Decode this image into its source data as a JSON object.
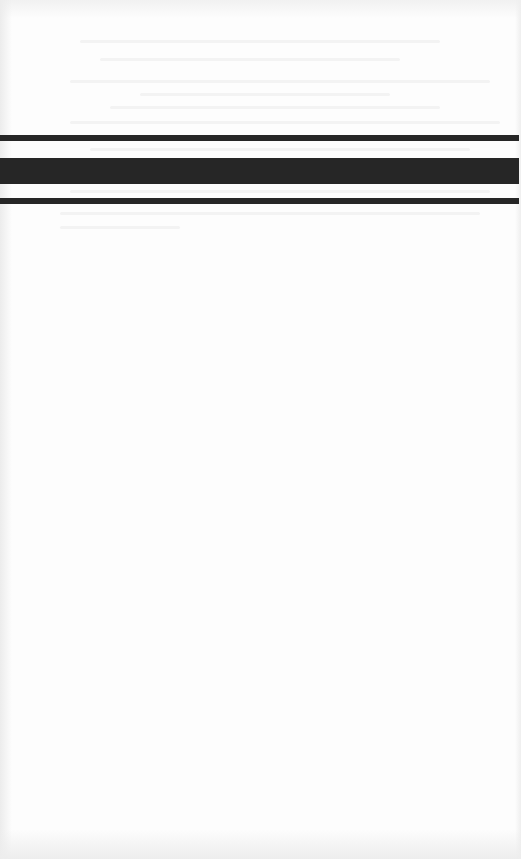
{
  "document": {
    "type": "scanned-page",
    "background_color": "#fdfdfd",
    "text_content": "",
    "divider": {
      "description": "triple horizontal rule (thin / thick / thin)",
      "color": "#262626",
      "rules": [
        {
          "name": "top-thin-rule",
          "top": 135,
          "height": 6
        },
        {
          "name": "thick-rule",
          "top": 158,
          "height": 26
        },
        {
          "name": "bottom-thin-rule",
          "top": 198,
          "height": 6
        }
      ]
    }
  }
}
